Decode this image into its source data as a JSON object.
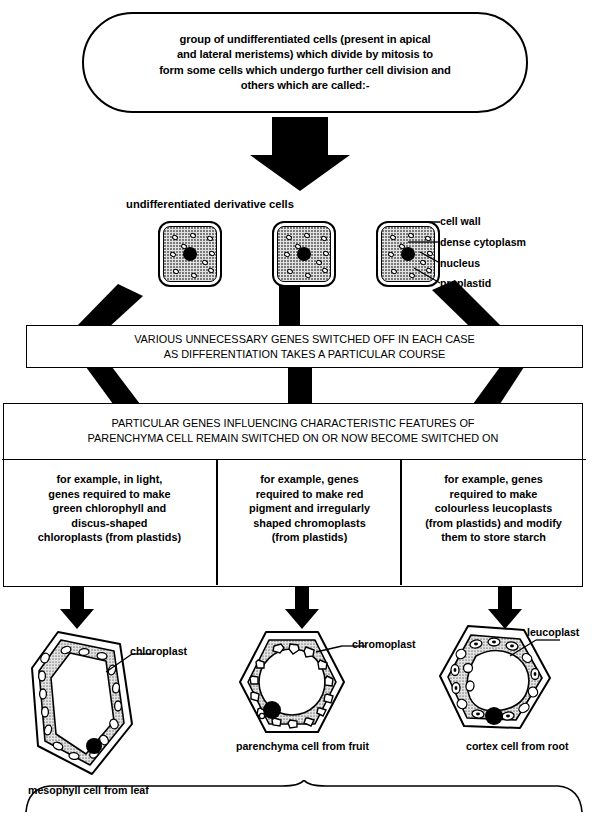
{
  "diagram": {
    "top_box": {
      "lines": [
        "group of undifferentiated cells (present in apical",
        "and lateral meristems) which divide by mitosis to",
        "form some cells which undergo further cell division and",
        "others which are called:-"
      ]
    },
    "derivative_cells": {
      "heading": "undifferentiated derivative cells",
      "cell_count": 3,
      "labels": [
        "cell wall",
        "dense cytoplasm",
        "nucleus",
        "proplastid"
      ]
    },
    "box1": {
      "lines": [
        "VARIOUS UNNECESSARY GENES SWITCHED OFF IN EACH CASE",
        "AS DIFFERENTIATION TAKES A PARTICULAR COURSE"
      ]
    },
    "box2": {
      "heading_lines": [
        "PARTICULAR GENES INFLUENCING  CHARACTERISTIC FEATURES OF",
        "PARENCHYMA CELL REMAIN SWITCHED ON OR NOW BECOME SWITCHED ON"
      ],
      "columns": [
        {
          "id": "chloroplast-column",
          "lines": [
            "for example, in light,",
            "genes required to make",
            "green chlorophyll and",
            "discus-shaped",
            "chloroplasts (from plastids)"
          ]
        },
        {
          "id": "chromoplast-column",
          "lines": [
            "for example, genes",
            "required to make red",
            "pigment and irregularly",
            "shaped chromoplasts",
            "(from plastids)"
          ]
        },
        {
          "id": "leucoplast-column",
          "lines": [
            "for example, genes",
            "required to make",
            "colourless leucoplasts",
            "(from plastids) and modify",
            "them to store starch"
          ]
        }
      ]
    },
    "results": [
      {
        "id": "mesophyll",
        "organelle_label": "chloroplast",
        "caption": "mesophyll cell from leaf"
      },
      {
        "id": "fruit-parenchyma",
        "organelle_label": "chromoplast",
        "caption": "parenchyma cell from fruit"
      },
      {
        "id": "root-cortex",
        "organelle_label": "leucoplast",
        "caption": "cortex cell from root"
      }
    ],
    "colors": {
      "ink": "#000000",
      "paper": "#ffffff",
      "cytoplasm_fill": "#e2e2e2"
    }
  }
}
